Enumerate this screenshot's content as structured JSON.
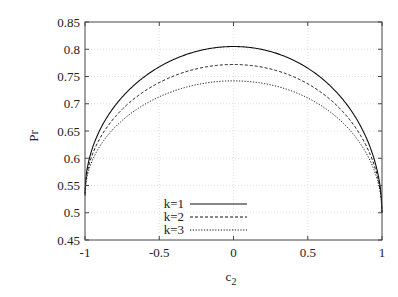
{
  "chart_data": {
    "type": "line",
    "title": "",
    "xlabel": "c2",
    "ylabel": "Pr",
    "xlim": [
      -1,
      1
    ],
    "ylim": [
      0.45,
      0.85
    ],
    "xticks": [
      "-1",
      "-0.5",
      "0",
      "0.5",
      "1"
    ],
    "yticks": [
      "0.45",
      "0.5",
      "0.55",
      "0.6",
      "0.65",
      "0.7",
      "0.75",
      "0.8",
      "0.85"
    ],
    "grid": true,
    "legend_position": "lower center",
    "x": [
      -1,
      -0.9,
      -0.75,
      -0.5,
      -0.25,
      0,
      0.25,
      0.5,
      0.75,
      0.9,
      1
    ],
    "series": [
      {
        "name": "k=1",
        "style": "solid",
        "peak": 0.805,
        "left_end": 0.535,
        "right_end": 0.5,
        "values": [
          0.535,
          0.675,
          0.731,
          0.776,
          0.799,
          0.805,
          0.797,
          0.769,
          0.718,
          0.654,
          0.5
        ]
      },
      {
        "name": "k=2",
        "style": "dashed",
        "peak": 0.772,
        "left_end": 0.533,
        "right_end": 0.5,
        "values": [
          0.533,
          0.657,
          0.707,
          0.747,
          0.767,
          0.772,
          0.765,
          0.74,
          0.694,
          0.636,
          0.5
        ]
      },
      {
        "name": "k=3",
        "style": "dotted",
        "peak": 0.742,
        "left_end": 0.531,
        "right_end": 0.5,
        "values": [
          0.531,
          0.639,
          0.683,
          0.719,
          0.737,
          0.742,
          0.736,
          0.713,
          0.673,
          0.621,
          0.5
        ]
      }
    ]
  },
  "labels": {
    "xlabel_main": "c",
    "xlabel_sub": "2",
    "ylabel": "Pr"
  }
}
